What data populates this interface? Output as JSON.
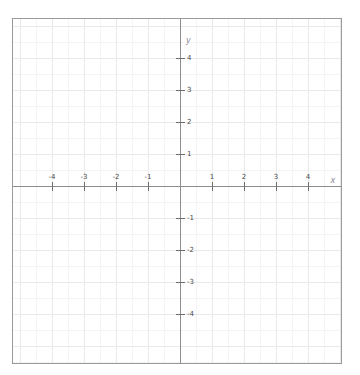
{
  "chart_data": {
    "type": "scatter",
    "title": "",
    "subtitle": "",
    "xlabel": "x",
    "ylabel": "y",
    "xlim": [
      -5.22,
      5.09
    ],
    "ylim": [
      -5.56,
      5.22
    ],
    "grid": true,
    "grid_major_step": 1,
    "grid_minor_step": 0.5,
    "legend": "none",
    "series": [],
    "x_ticks": [
      {
        "value": -4,
        "label": "-4"
      },
      {
        "value": -3,
        "label": "-3"
      },
      {
        "value": -2,
        "label": "-2"
      },
      {
        "value": -1,
        "label": "-1"
      },
      {
        "value": 1,
        "label": "1"
      },
      {
        "value": 2,
        "label": "2"
      },
      {
        "value": 3,
        "label": "3"
      },
      {
        "value": 4,
        "label": "4"
      }
    ],
    "y_ticks": [
      {
        "value": 4,
        "label": "4"
      },
      {
        "value": 3,
        "label": "3"
      },
      {
        "value": 2,
        "label": "2"
      },
      {
        "value": 1,
        "label": "1"
      },
      {
        "value": -1,
        "label": "-1"
      },
      {
        "value": -2,
        "label": "-2"
      },
      {
        "value": -3,
        "label": "-3"
      },
      {
        "value": -4,
        "label": "-4"
      }
    ],
    "origin_px": {
      "x": 167,
      "y": 167
    },
    "unit_px": 32,
    "colors": {
      "axis": "#8d8d8d",
      "grid_major": "#e9e9ec",
      "grid_minor": "#f4f4f6",
      "border": "#9a9a9a",
      "tick_label": "#4a4a4a",
      "axis_label": "#8a8a99",
      "background": "#ffffff"
    }
  }
}
